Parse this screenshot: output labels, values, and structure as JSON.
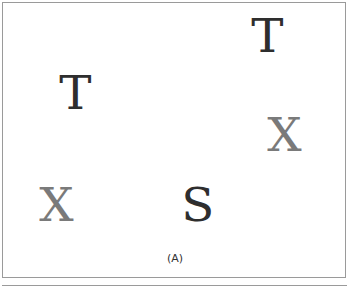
{
  "figure": {
    "caption": "(A)",
    "letters": [
      {
        "char": "T",
        "shade": "dark",
        "color": "#2e2e2e"
      },
      {
        "char": "T",
        "shade": "dark",
        "color": "#2e2e2e"
      },
      {
        "char": "X",
        "shade": "gray",
        "color": "#7a7a7a"
      },
      {
        "char": "X",
        "shade": "gray",
        "color": "#7a7a7a"
      },
      {
        "char": "S",
        "shade": "dark",
        "color": "#2e2e2e"
      }
    ]
  }
}
